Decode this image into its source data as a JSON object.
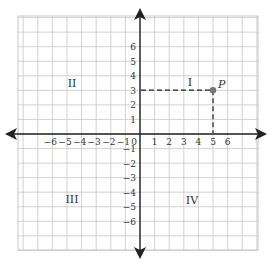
{
  "diagram": {
    "type": "coordinate-plane",
    "origin_label": "0",
    "x_ticks": [
      "-6",
      "-5",
      "-4",
      "-3",
      "-2",
      "-1",
      "1",
      "2",
      "3",
      "4",
      "5",
      "6"
    ],
    "y_ticks": [
      "6",
      "5",
      "4",
      "3",
      "2",
      "1",
      "-1",
      "-2",
      "-3",
      "-4",
      "-5",
      "-6"
    ],
    "quadrants": {
      "I": "I",
      "II": "II",
      "III": "III",
      "IV": "IV"
    },
    "point": {
      "label": "P",
      "x": 5,
      "y": 3
    },
    "colors": {
      "grid": "#c8c8c8",
      "axis": "#222222",
      "point": "#777777",
      "dashed": "#222222"
    }
  }
}
